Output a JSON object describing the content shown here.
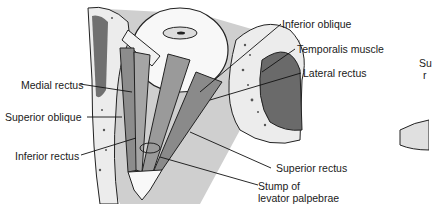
{
  "diagram": {
    "labels": {
      "inferior_oblique": "Inferior oblique",
      "temporalis_muscle": "Temporalis muscle",
      "lateral_rectus": "Lateral rectus",
      "medial_rectus": "Medial rectus",
      "superior_oblique": "Superior oblique",
      "inferior_rectus": "Inferior rectus",
      "superior_rectus": "Superior rectus",
      "stump_line1": "Stump of",
      "stump_line2": "levator palpebrae",
      "partial_right_line1": "Su",
      "partial_right_line2": "r"
    },
    "colors": {
      "background": "#ffffff",
      "bone": "#e8e8e8",
      "orbit_gray": "#c8c8c8",
      "dark_fill": "#6e6e6e",
      "muscle": "#9a9a9a",
      "outline": "#1a1a1a"
    }
  }
}
